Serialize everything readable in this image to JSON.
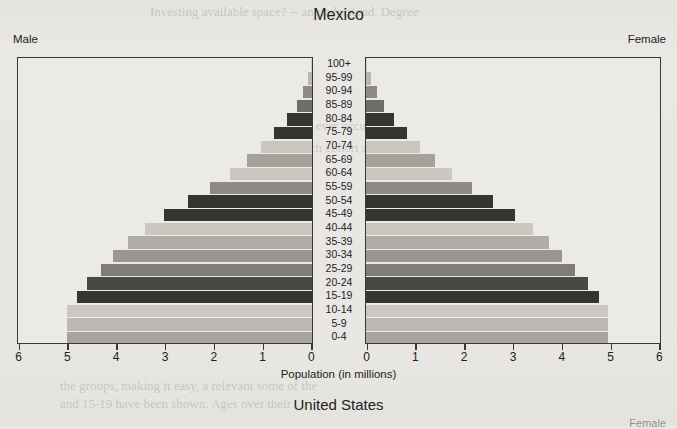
{
  "page": {
    "background_color": "#e8e7e3",
    "ghost_text": [
      {
        "text": "Investing available space? -- an understand. Degree",
        "x": 150,
        "y": 4,
        "size": 13
      },
      {
        "text": "for the 100 to which could ever occur as example. Maybe the",
        "x": 175,
        "y": 118,
        "size": 13
      },
      {
        "text": "number of people in each cohort same of them have",
        "x": 190,
        "y": 140,
        "size": 13
      },
      {
        "text": "the groups, making it easy, a relevant some of the",
        "x": 60,
        "y": 378,
        "size": 13
      },
      {
        "text": "and 15-19 have been shown. Ages over their",
        "x": 60,
        "y": 396,
        "size": 13
      }
    ]
  },
  "chart_data": {
    "type": "bar",
    "subtype": "population-pyramid",
    "title": "Mexico",
    "xlabel": "Population (in millions)",
    "ylabel": "",
    "left_panel_label": "Male",
    "right_panel_label": "Female",
    "xlim": [
      0,
      6
    ],
    "xticks": [
      0,
      1,
      2,
      3,
      4,
      5,
      6
    ],
    "left_xticks_order": [
      6,
      5,
      4,
      3,
      2,
      1,
      0
    ],
    "right_xticks_order": [
      0,
      1,
      2,
      3,
      4,
      5,
      6
    ],
    "grid": false,
    "legend": "none",
    "categories": [
      "100+",
      "95-99",
      "90-94",
      "85-89",
      "80-84",
      "75-79",
      "70-74",
      "65-69",
      "60-64",
      "55-59",
      "50-54",
      "45-49",
      "40-44",
      "35-39",
      "30-34",
      "25-29",
      "20-24",
      "15-19",
      "10-14",
      "5-9",
      "0-4"
    ],
    "series": [
      {
        "name": "Male",
        "side": "left",
        "values": [
          0.02,
          0.09,
          0.18,
          0.32,
          0.52,
          0.78,
          1.05,
          1.35,
          1.7,
          2.1,
          2.55,
          3.05,
          3.45,
          3.8,
          4.1,
          4.35,
          4.65,
          4.85,
          5.05,
          5.05,
          5.05
        ]
      },
      {
        "name": "Female",
        "side": "right",
        "values": [
          0.03,
          0.11,
          0.22,
          0.38,
          0.58,
          0.85,
          1.12,
          1.42,
          1.78,
          2.18,
          2.62,
          3.08,
          3.45,
          3.78,
          4.05,
          4.32,
          4.58,
          4.8,
          5.0,
          5.0,
          5.0
        ]
      }
    ],
    "bar_colors": [
      "#c9c6c0",
      "#b9b6b0",
      "#8d8a85",
      "#6f6d69",
      "#363431",
      "#363431",
      "#c9c6c0",
      "#a5a29c",
      "#cbc8c2",
      "#8d8a85",
      "#363431",
      "#363431",
      "#cbc8c2",
      "#b0ada7",
      "#9a9792",
      "#807d78",
      "#4a4845",
      "#363431",
      "#cbc8c2",
      "#bcb9b3",
      "#a8a5a0"
    ],
    "axis_color": "#3a3835",
    "plot_background": "#eceae5"
  },
  "next_chart": {
    "title": "United States",
    "right_panel_label": "Female"
  }
}
